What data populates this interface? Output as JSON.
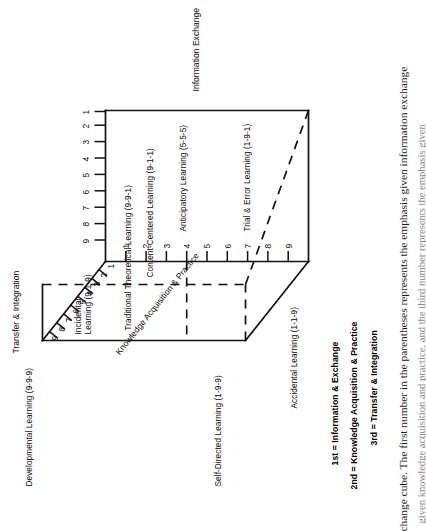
{
  "figure": {
    "axes": [
      {
        "id": "information-exchange",
        "title": "Information Exchange",
        "ticks": [
          "1",
          "2",
          "3",
          "4",
          "5",
          "6",
          "7",
          "8",
          "9"
        ]
      },
      {
        "id": "transfer-integration",
        "title": "Transfer & Integration",
        "ticks": [
          "1",
          "2",
          "3",
          "4",
          "5",
          "6",
          "7",
          "8",
          "9"
        ]
      },
      {
        "id": "knowledge-acquisition-practice",
        "title": "Knowledge Acquisition & Practice",
        "ticks": [
          "1",
          "2",
          "3",
          "4",
          "5",
          "6",
          "7",
          "8",
          "9"
        ]
      }
    ],
    "vertex_labels": [
      {
        "id": "developmental-learning",
        "text": "Developmental Learning (9-9-9)"
      },
      {
        "id": "traditional-theoretical-learning",
        "text": "Traditional Theoretical Learning (9-9-1)"
      },
      {
        "id": "incidental-learning",
        "text": "Incidental\nLearning (9-1-9)"
      },
      {
        "id": "content-centered-learning",
        "text": "Content-Centered Learning (9-1-1)"
      },
      {
        "id": "self-directed-learning",
        "text": "Self-Directed Learning (1-9-9)"
      },
      {
        "id": "accidental-learning",
        "text": "Accidental Learning (1-1-9)"
      },
      {
        "id": "anticipatory-learning",
        "text": "Anticipatory Learning (5-5-5)"
      },
      {
        "id": "trial-and-error-learning",
        "text": "Trial & Error Learning (1-9-1)"
      }
    ],
    "legend": {
      "items": [
        {
          "key": "1st",
          "label": "1st = Information & Exchange"
        },
        {
          "key": "2nd",
          "label": "2nd = Knowledge Acquisition & Practice"
        },
        {
          "key": "3rd",
          "label": "3rd = Transfer & Integration"
        }
      ]
    },
    "caption": {
      "line1": "change cube. The first number in the parentheses represents the emphasis given information exchange",
      "line2": "given knowledge acquisition and practice, and the third number represents the emphasis given"
    },
    "colors": {
      "stroke": "#111111",
      "background": "#ffffff",
      "text": "#0d0d0d"
    }
  }
}
